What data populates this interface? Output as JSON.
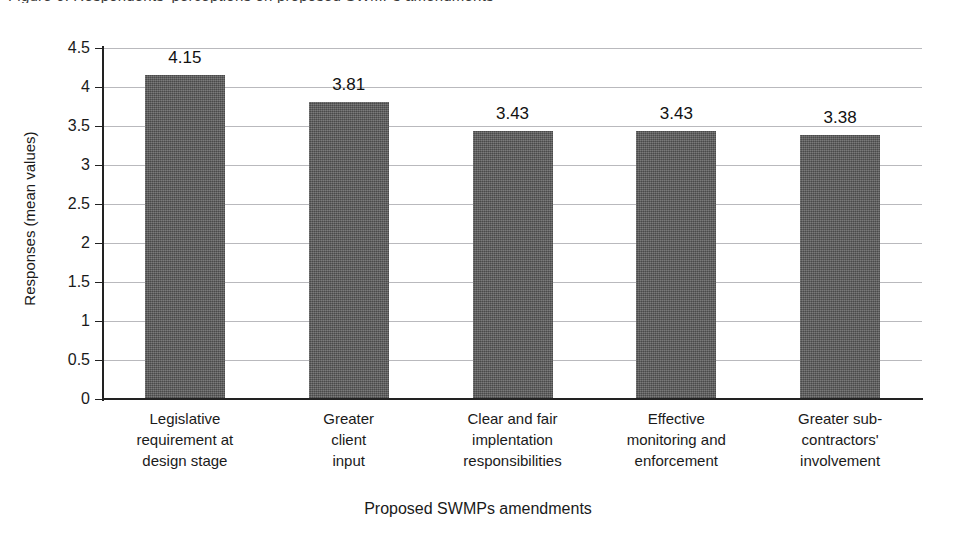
{
  "figure": {
    "caption_remnant": "Figure 6. Respondents' perceptions on proposed SWMPs amendments"
  },
  "chart_data": {
    "type": "bar",
    "title": "",
    "xlabel": "Proposed SWMPs amendments",
    "ylabel": "Responses (mean values)",
    "categories": [
      "Legislative requirement at design stage",
      "Greater client input",
      "Clear and fair implentation responsibilities",
      "Effective monitoring and enforcement",
      "Greater sub-contractors' involvement"
    ],
    "category_lines": [
      [
        "Legislative",
        "requirement at",
        "design stage"
      ],
      [
        "Greater",
        "client",
        "input"
      ],
      [
        "Clear and fair",
        "implentation",
        "responsibilities"
      ],
      [
        "Effective",
        "monitoring and",
        "enforcement"
      ],
      [
        "Greater sub-",
        "contractors'",
        "involvement"
      ]
    ],
    "values": [
      4.15,
      3.81,
      3.43,
      3.43,
      3.38
    ],
    "value_labels": [
      "4.15",
      "3.81",
      "3.43",
      "3.43",
      "3.38"
    ],
    "ylim": [
      0,
      4.5
    ],
    "ytick_labels": [
      "0",
      "0.5",
      "1",
      "1.5",
      "2",
      "2.5",
      "3",
      "3.5",
      "4",
      "4.5"
    ],
    "ytick_values": [
      0,
      0.5,
      1,
      1.5,
      2,
      2.5,
      3,
      3.5,
      4,
      4.5
    ],
    "grid": true,
    "legend": false,
    "bar_color": "#5d5d5d",
    "gridline_color": "#b9b9bd",
    "axis_color": "#222222"
  }
}
